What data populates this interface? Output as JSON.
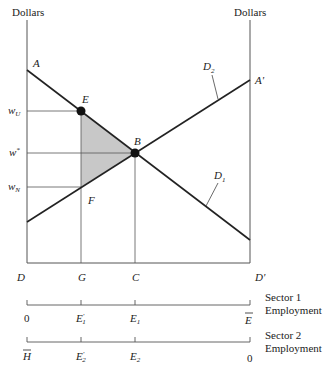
{
  "diagram": {
    "type": "two-sector wage determination diagram",
    "axes": {
      "left_label": "Dollars",
      "right_label": "Dollars",
      "bottom_left": "D",
      "bottom_right": "D'"
    },
    "curves": {
      "D1": {
        "label": "D",
        "subscript": "1",
        "from": "A",
        "to": "bottom right"
      },
      "D2": {
        "label": "D",
        "subscript": "2",
        "from": "bottom left",
        "to": "A'"
      }
    },
    "points": {
      "A": "A",
      "A_prime": "A'",
      "E": "E",
      "B": "B",
      "F": "F",
      "G": "G",
      "C": "C"
    },
    "wage_labels": {
      "wU": {
        "base": "w",
        "sub": "U"
      },
      "wstar": {
        "base": "w",
        "sup": "*"
      },
      "wN": {
        "base": "w",
        "sub": "N"
      }
    },
    "shaded_region": "triangle EBF",
    "colors": {
      "line": "#222222",
      "guide": "#555555",
      "shade": "#c8c8c8"
    }
  },
  "scales": {
    "sector1": {
      "title_line1": "Sector 1",
      "title_line2": "Employment",
      "ticks": [
        {
          "label": "0"
        },
        {
          "label": "E",
          "prime": "'",
          "sub": "1"
        },
        {
          "label": "E",
          "sub": "1"
        },
        {
          "label": "E",
          "overbar": true
        }
      ]
    },
    "sector2": {
      "title_line1": "Sector 2",
      "title_line2": "Employment",
      "ticks": [
        {
          "label": "H",
          "overbar": true
        },
        {
          "label": "E",
          "prime": "'",
          "sub": "2"
        },
        {
          "label": "E",
          "sub": "2"
        },
        {
          "label": "0"
        }
      ]
    }
  }
}
